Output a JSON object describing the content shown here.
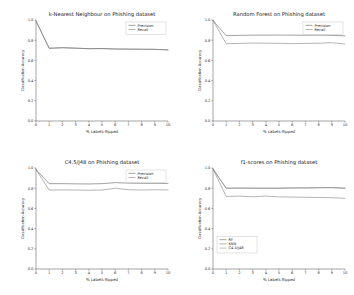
{
  "figure": {
    "background": "#ffffff",
    "layout": "2x2 grid of line charts",
    "n_panels": 4
  },
  "style": {
    "line_color_1": "#555555",
    "line_color_2": "#777777",
    "line_color_3": "#8f8f8f",
    "axis_color": "#4a4a4a",
    "text_color": "#1a1a1a"
  },
  "chart_data": [
    {
      "type": "line",
      "title": "k-Nearest Neighbour on Phishing dataset",
      "xlabel": "% Labels flipped",
      "ylabel": "Classification Accuracy",
      "x": [
        0,
        1,
        2,
        3,
        4,
        5,
        6,
        7,
        8,
        9,
        10
      ],
      "xlim": [
        0,
        10
      ],
      "ylim": [
        0.0,
        1.0
      ],
      "xticks": [
        0,
        1,
        2,
        3,
        4,
        5,
        6,
        7,
        8,
        9,
        10
      ],
      "yticks": [
        0.0,
        0.2,
        0.4,
        0.6,
        0.8,
        1.0
      ],
      "grid": false,
      "legend_position": "upper right",
      "series": [
        {
          "name": "Precision",
          "values": [
            0.99,
            0.72,
            0.725,
            0.722,
            0.715,
            0.718,
            0.713,
            0.712,
            0.711,
            0.71,
            0.705
          ]
        },
        {
          "name": "Recall",
          "values": [
            0.99,
            0.72,
            0.726,
            0.72,
            0.717,
            0.716,
            0.712,
            0.711,
            0.71,
            0.709,
            0.704
          ]
        }
      ]
    },
    {
      "type": "line",
      "title": "Random Forest on Phishing dataset",
      "xlabel": "% Labels flipped",
      "ylabel": "Classification Accuracy",
      "x": [
        0,
        1,
        2,
        3,
        4,
        5,
        6,
        7,
        8,
        9,
        10
      ],
      "xlim": [
        0,
        10
      ],
      "ylim": [
        0.0,
        1.0
      ],
      "xticks": [
        0,
        1,
        2,
        3,
        4,
        5,
        6,
        7,
        8,
        9,
        10
      ],
      "yticks": [
        0.0,
        0.2,
        0.4,
        0.6,
        0.8,
        1.0
      ],
      "grid": false,
      "legend_position": "upper right",
      "series": [
        {
          "name": "Precision",
          "values": [
            0.995,
            0.845,
            0.848,
            0.85,
            0.85,
            0.851,
            0.85,
            0.849,
            0.85,
            0.848,
            0.843
          ]
        },
        {
          "name": "Recall",
          "values": [
            0.995,
            0.765,
            0.768,
            0.772,
            0.77,
            0.769,
            0.766,
            0.768,
            0.77,
            0.775,
            0.762
          ]
        }
      ]
    },
    {
      "type": "line",
      "title": "C4.5/J48 on Phishing dataset",
      "xlabel": "% Labels flipped",
      "ylabel": "Classification Accuracy",
      "x": [
        0,
        1,
        2,
        3,
        4,
        5,
        6,
        7,
        8,
        9,
        10
      ],
      "xlim": [
        0,
        10
      ],
      "ylim": [
        0.0,
        1.0
      ],
      "xticks": [
        0,
        1,
        2,
        3,
        4,
        5,
        6,
        7,
        8,
        9,
        10
      ],
      "yticks": [
        0.0,
        0.2,
        0.4,
        0.6,
        0.8,
        1.0
      ],
      "grid": false,
      "legend_position": "upper right",
      "series": [
        {
          "name": "Precision",
          "values": [
            0.985,
            0.845,
            0.845,
            0.843,
            0.842,
            0.845,
            0.855,
            0.85,
            0.848,
            0.848,
            0.847
          ]
        },
        {
          "name": "Recall",
          "values": [
            0.985,
            0.782,
            0.783,
            0.782,
            0.78,
            0.782,
            0.8,
            0.785,
            0.782,
            0.785,
            0.783
          ]
        }
      ]
    },
    {
      "type": "line",
      "title": "f1-scores on Phishing dataset",
      "xlabel": "% Labels flipped",
      "ylabel": "Classification Accuracy",
      "x": [
        0,
        1,
        2,
        3,
        4,
        5,
        6,
        7,
        8,
        9,
        10
      ],
      "xlim": [
        0,
        10
      ],
      "ylim": [
        0.0,
        1.0
      ],
      "xticks": [
        0,
        1,
        2,
        3,
        4,
        5,
        6,
        7,
        8,
        9,
        10
      ],
      "yticks": [
        0.0,
        0.2,
        0.4,
        0.6,
        0.8,
        1.0
      ],
      "grid": false,
      "legend_position": "lower left",
      "series": [
        {
          "name": "RF",
          "values": [
            0.99,
            0.8,
            0.802,
            0.8,
            0.8,
            0.8,
            0.802,
            0.803,
            0.805,
            0.807,
            0.8
          ]
        },
        {
          "name": "KNN",
          "values": [
            0.99,
            0.718,
            0.722,
            0.715,
            0.722,
            0.714,
            0.712,
            0.71,
            0.708,
            0.706,
            0.7
          ]
        },
        {
          "name": "C4.5/J48",
          "values": [
            0.99,
            0.8,
            0.801,
            0.8,
            0.799,
            0.8,
            0.803,
            0.802,
            0.804,
            0.805,
            0.799
          ]
        }
      ]
    }
  ]
}
